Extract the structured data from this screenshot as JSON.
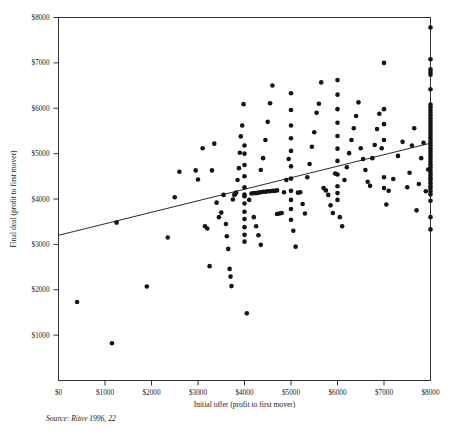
{
  "chart_data": {
    "type": "scatter",
    "title": "",
    "xlabel": "Initial offer (profit to first mover)",
    "ylabel": "Final deal (profit to first mover)",
    "source": "Source: Ritov 1996, 22",
    "xlim": [
      0,
      8000
    ],
    "ylim": [
      0,
      8000
    ],
    "grid": false,
    "legend": "none",
    "xticks": [
      0,
      1000,
      2000,
      3000,
      4000,
      5000,
      6000,
      7000,
      8000
    ],
    "xticklabels": [
      "$0",
      "$1000",
      "$2000",
      "$3000",
      "$4000",
      "$5000",
      "$6000",
      "$7000",
      "$8000"
    ],
    "yticks": [
      0,
      1000,
      2000,
      3000,
      4000,
      5000,
      6000,
      7000,
      8000
    ],
    "yticklabels": [
      "$0",
      "$1000",
      "$2000",
      "$3000",
      "$4000",
      "$5000",
      "$6000",
      "$7000",
      "$8000"
    ],
    "ytick_labels_shown": [
      "$1000",
      "$2000",
      "$3000",
      "$4000",
      "$5000",
      "$6000",
      "$7000",
      "$8000"
    ],
    "marker": "filled-circle",
    "marker_color": "#141414",
    "marker_size_px": 4.6,
    "trendline": {
      "type": "linear-fit",
      "x_start": 0,
      "y_start": 3200,
      "x_end": 8000,
      "y_end": 5230,
      "color": "#111111"
    },
    "points": [
      [
        400,
        1730
      ],
      [
        1150,
        820
      ],
      [
        1250,
        3480
      ],
      [
        1900,
        2070
      ],
      [
        2350,
        3150
      ],
      [
        2500,
        4040
      ],
      [
        2600,
        4600
      ],
      [
        2950,
        4630
      ],
      [
        3000,
        4430
      ],
      [
        3100,
        5120
      ],
      [
        3150,
        3400
      ],
      [
        3200,
        3350
      ],
      [
        3250,
        2520
      ],
      [
        3300,
        4630
      ],
      [
        3350,
        5220
      ],
      [
        3400,
        3920
      ],
      [
        3450,
        3600
      ],
      [
        3500,
        3700
      ],
      [
        3550,
        4090
      ],
      [
        3600,
        3450
      ],
      [
        3620,
        3180
      ],
      [
        3650,
        2900
      ],
      [
        3680,
        2460
      ],
      [
        3700,
        2290
      ],
      [
        3720,
        2080
      ],
      [
        3750,
        3990
      ],
      [
        3780,
        4090
      ],
      [
        3800,
        4110
      ],
      [
        3820,
        4140
      ],
      [
        3850,
        4420
      ],
      [
        3880,
        4680
      ],
      [
        3900,
        5020
      ],
      [
        3920,
        5380
      ],
      [
        3950,
        5620
      ],
      [
        3980,
        6090
      ],
      [
        4000,
        4100
      ],
      [
        4000,
        4060
      ],
      [
        4000,
        3900
      ],
      [
        4000,
        3720
      ],
      [
        4000,
        3560
      ],
      [
        4000,
        3380
      ],
      [
        4000,
        3210
      ],
      [
        4000,
        3060
      ],
      [
        4000,
        4260
      ],
      [
        4000,
        4500
      ],
      [
        4000,
        4750
      ],
      [
        4000,
        5000
      ],
      [
        4000,
        5180
      ],
      [
        4050,
        1480
      ],
      [
        4100,
        3980
      ],
      [
        4150,
        4120
      ],
      [
        4200,
        4130
      ],
      [
        4250,
        4130
      ],
      [
        4300,
        4140
      ],
      [
        4350,
        4150
      ],
      [
        4400,
        4160
      ],
      [
        4450,
        4160
      ],
      [
        4500,
        4170
      ],
      [
        4550,
        4170
      ],
      [
        4600,
        4180
      ],
      [
        4650,
        4180
      ],
      [
        4700,
        4190
      ],
      [
        4200,
        3600
      ],
      [
        4250,
        3400
      ],
      [
        4300,
        3200
      ],
      [
        4350,
        4640
      ],
      [
        4400,
        4900
      ],
      [
        4450,
        5300
      ],
      [
        4500,
        5700
      ],
      [
        4550,
        6110
      ],
      [
        4600,
        6500
      ],
      [
        4350,
        2990
      ],
      [
        4700,
        3670
      ],
      [
        4750,
        3680
      ],
      [
        4800,
        3690
      ],
      [
        4850,
        4150
      ],
      [
        4900,
        4420
      ],
      [
        4950,
        4880
      ],
      [
        5000,
        4180
      ],
      [
        5000,
        3980
      ],
      [
        5000,
        3780
      ],
      [
        5000,
        3540
      ],
      [
        5000,
        4450
      ],
      [
        5000,
        4720
      ],
      [
        5000,
        5060
      ],
      [
        5000,
        5340
      ],
      [
        5000,
        5620
      ],
      [
        5000,
        5960
      ],
      [
        5000,
        6330
      ],
      [
        5050,
        3300
      ],
      [
        5100,
        2950
      ],
      [
        5150,
        4140
      ],
      [
        5200,
        4150
      ],
      [
        5250,
        3890
      ],
      [
        5300,
        3680
      ],
      [
        5350,
        4480
      ],
      [
        5400,
        4770
      ],
      [
        5450,
        5150
      ],
      [
        5500,
        5470
      ],
      [
        5550,
        5900
      ],
      [
        5600,
        6100
      ],
      [
        5650,
        6570
      ],
      [
        5700,
        4240
      ],
      [
        5750,
        4190
      ],
      [
        5800,
        4090
      ],
      [
        5850,
        3860
      ],
      [
        5900,
        3690
      ],
      [
        5950,
        4560
      ],
      [
        6000,
        4280
      ],
      [
        6000,
        4130
      ],
      [
        6000,
        3980
      ],
      [
        6000,
        4540
      ],
      [
        6000,
        4840
      ],
      [
        6000,
        5110
      ],
      [
        6000,
        5390
      ],
      [
        6000,
        5680
      ],
      [
        6000,
        5980
      ],
      [
        6000,
        6300
      ],
      [
        6000,
        6620
      ],
      [
        6050,
        3600
      ],
      [
        6100,
        3400
      ],
      [
        6150,
        4420
      ],
      [
        6200,
        4700
      ],
      [
        6250,
        5010
      ],
      [
        6300,
        5300
      ],
      [
        6350,
        5560
      ],
      [
        6400,
        5830
      ],
      [
        6450,
        6130
      ],
      [
        6500,
        5120
      ],
      [
        6550,
        4880
      ],
      [
        6600,
        4640
      ],
      [
        6650,
        4380
      ],
      [
        6700,
        4290
      ],
      [
        6750,
        4900
      ],
      [
        6800,
        5190
      ],
      [
        6850,
        5540
      ],
      [
        6900,
        5880
      ],
      [
        6950,
        5120
      ],
      [
        7000,
        4480
      ],
      [
        7000,
        4240
      ],
      [
        7000,
        5300
      ],
      [
        7000,
        5650
      ],
      [
        7000,
        5980
      ],
      [
        7000,
        7000
      ],
      [
        7050,
        3880
      ],
      [
        7100,
        4180
      ],
      [
        7200,
        4440
      ],
      [
        7300,
        4950
      ],
      [
        7400,
        5260
      ],
      [
        7500,
        4260
      ],
      [
        7550,
        4580
      ],
      [
        7600,
        5180
      ],
      [
        7650,
        5560
      ],
      [
        7700,
        3750
      ],
      [
        7750,
        4330
      ],
      [
        7800,
        4900
      ],
      [
        7850,
        5240
      ],
      [
        7900,
        4170
      ],
      [
        7950,
        4650
      ],
      [
        8000,
        7780
      ],
      [
        8000,
        7080
      ],
      [
        8000,
        6860
      ],
      [
        8000,
        6800
      ],
      [
        8000,
        6740
      ],
      [
        8000,
        6420
      ],
      [
        8000,
        6080
      ],
      [
        8000,
        6020
      ],
      [
        8000,
        5960
      ],
      [
        8000,
        5900
      ],
      [
        8000,
        5840
      ],
      [
        8000,
        5780
      ],
      [
        8000,
        5720
      ],
      [
        8000,
        5660
      ],
      [
        8000,
        5600
      ],
      [
        8000,
        5540
      ],
      [
        8000,
        5480
      ],
      [
        8000,
        5420
      ],
      [
        8000,
        5360
      ],
      [
        8000,
        5300
      ],
      [
        8000,
        5240
      ],
      [
        8000,
        5180
      ],
      [
        8000,
        5120
      ],
      [
        8000,
        5060
      ],
      [
        8000,
        5000
      ],
      [
        8000,
        4940
      ],
      [
        8000,
        4880
      ],
      [
        8000,
        4820
      ],
      [
        8000,
        4760
      ],
      [
        8000,
        4700
      ],
      [
        8000,
        4640
      ],
      [
        8000,
        4580
      ],
      [
        8000,
        4520
      ],
      [
        8000,
        4460
      ],
      [
        8000,
        4400
      ],
      [
        8000,
        4340
      ],
      [
        8000,
        4280
      ],
      [
        8000,
        4220
      ],
      [
        8000,
        4160
      ],
      [
        8000,
        4100
      ],
      [
        8000,
        3960
      ],
      [
        8000,
        3600
      ],
      [
        8000,
        3330
      ]
    ]
  }
}
